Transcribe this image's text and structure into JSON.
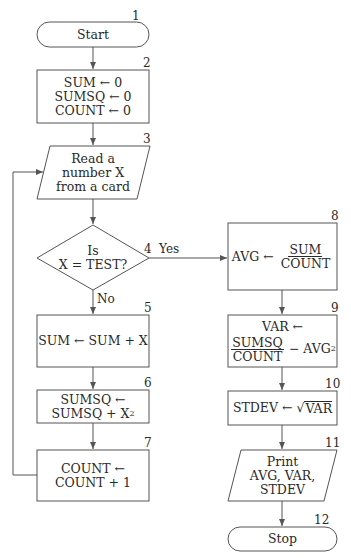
{
  "flowchart": {
    "nodes": [
      {
        "id": "1",
        "type": "terminal",
        "label": "Start"
      },
      {
        "id": "2",
        "type": "process",
        "lines": [
          "SUM ← 0",
          "SUMSQ ← 0",
          "COUNT ← 0"
        ]
      },
      {
        "id": "3",
        "type": "input",
        "lines": [
          "Read a",
          "number X",
          "from a card"
        ]
      },
      {
        "id": "4",
        "type": "decision",
        "lines": [
          "Is",
          "X = TEST?"
        ]
      },
      {
        "id": "5",
        "type": "process",
        "lines": [
          "SUM ← SUM + X"
        ]
      },
      {
        "id": "6",
        "type": "process",
        "lines": [
          "SUMSQ ←",
          "SUMSQ + X"
        ],
        "superscript": "2"
      },
      {
        "id": "7",
        "type": "process",
        "lines": [
          "COUNT ←",
          "COUNT + 1"
        ]
      },
      {
        "id": "8",
        "type": "process",
        "lhs": "AVG ←",
        "numerator": "SUM",
        "denominator": "COUNT"
      },
      {
        "id": "9",
        "type": "process",
        "line1": "VAR ←",
        "numerator": "SUMSQ",
        "denominator": "COUNT",
        "tail": "− AVG",
        "superscript": "2"
      },
      {
        "id": "10",
        "type": "process",
        "lhs": "STDEV ←",
        "sqrt_symbol": "√",
        "radicand": "VAR"
      },
      {
        "id": "11",
        "type": "output",
        "lines": [
          "Print",
          "AVG, VAR,",
          "STDEV"
        ]
      },
      {
        "id": "12",
        "type": "terminal",
        "label": "Stop"
      }
    ],
    "edges": [
      {
        "from": "1",
        "to": "2"
      },
      {
        "from": "2",
        "to": "3"
      },
      {
        "from": "3",
        "to": "4"
      },
      {
        "from": "4",
        "to": "5",
        "label": "No"
      },
      {
        "from": "4",
        "to": "8",
        "label": "Yes"
      },
      {
        "from": "5",
        "to": "6"
      },
      {
        "from": "6",
        "to": "7"
      },
      {
        "from": "7",
        "to": "3"
      },
      {
        "from": "8",
        "to": "9"
      },
      {
        "from": "9",
        "to": "10"
      },
      {
        "from": "10",
        "to": "11"
      },
      {
        "from": "11",
        "to": "12"
      }
    ],
    "edge_labels": {
      "yes": "Yes",
      "no": "No"
    },
    "colors": {
      "stroke": "#555555",
      "text": "#2a2a2a",
      "background": "#ffffff"
    }
  }
}
